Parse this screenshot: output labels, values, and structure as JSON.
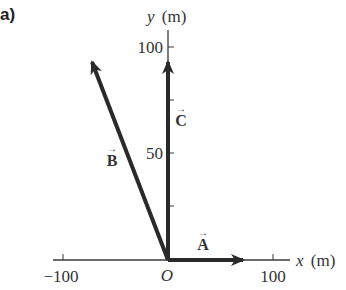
{
  "figure": {
    "panel_label": "a)",
    "origin_label": "O",
    "x_axis": {
      "label_var": "x",
      "label_unit": "(m)",
      "ticks": [
        "−100",
        "100"
      ]
    },
    "y_axis": {
      "label_var": "y",
      "label_unit": "(m)",
      "ticks": [
        "100",
        "50"
      ]
    },
    "vectors": [
      {
        "name": "A",
        "label": "A",
        "arrow": "→"
      },
      {
        "name": "B",
        "label": "B",
        "arrow": "→"
      },
      {
        "name": "C",
        "label": "C",
        "arrow": "→"
      }
    ],
    "colors": {
      "vector": "#2a2a2a",
      "axis": "#3a3a3a",
      "text": "#333333"
    }
  }
}
